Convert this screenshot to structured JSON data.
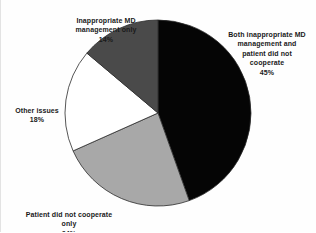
{
  "chart_data": {
    "type": "pie",
    "title": "",
    "subtitle": "",
    "xlabel": "",
    "ylabel": "",
    "legend_position": "outside-labels",
    "grid": false,
    "start_angle_deg": 0,
    "direction": "clockwise",
    "center": {
      "cx": 157,
      "cy": 113,
      "r": 93
    },
    "categories": [
      "Both inappropriate MD management and patient did not cooperate",
      "Patient did not cooperate only",
      "Other issues",
      "Inappropriate MD management only"
    ],
    "values": [
      45,
      24,
      18,
      14
    ],
    "value_suffix": "%",
    "colors": [
      "#050505",
      "#a8a8a8",
      "#ffffff",
      "#4a4a4a"
    ],
    "slices": [
      {
        "name": "both-inappropriate-md-and-patient-not-cooperate",
        "label": "Both inappropriate MD\nmanagement and\npatient did not\ncooperate",
        "percent_text": "45%",
        "value": 45,
        "color": "#050505"
      },
      {
        "name": "patient-did-not-cooperate-only",
        "label": "Patient did not cooperate\nonly",
        "percent_text": "24%",
        "value": 24,
        "color": "#a8a8a8"
      },
      {
        "name": "other-issues",
        "label": "Other issues",
        "percent_text": "18%",
        "value": 18,
        "color": "#ffffff"
      },
      {
        "name": "inappropriate-md-management-only",
        "label": "Inappropriate MD\nmanagement only",
        "percent_text": "14%",
        "value": 14,
        "color": "#4a4a4a"
      }
    ],
    "stroke_color": "#2b2b2b",
    "stroke_width": 0.8
  }
}
